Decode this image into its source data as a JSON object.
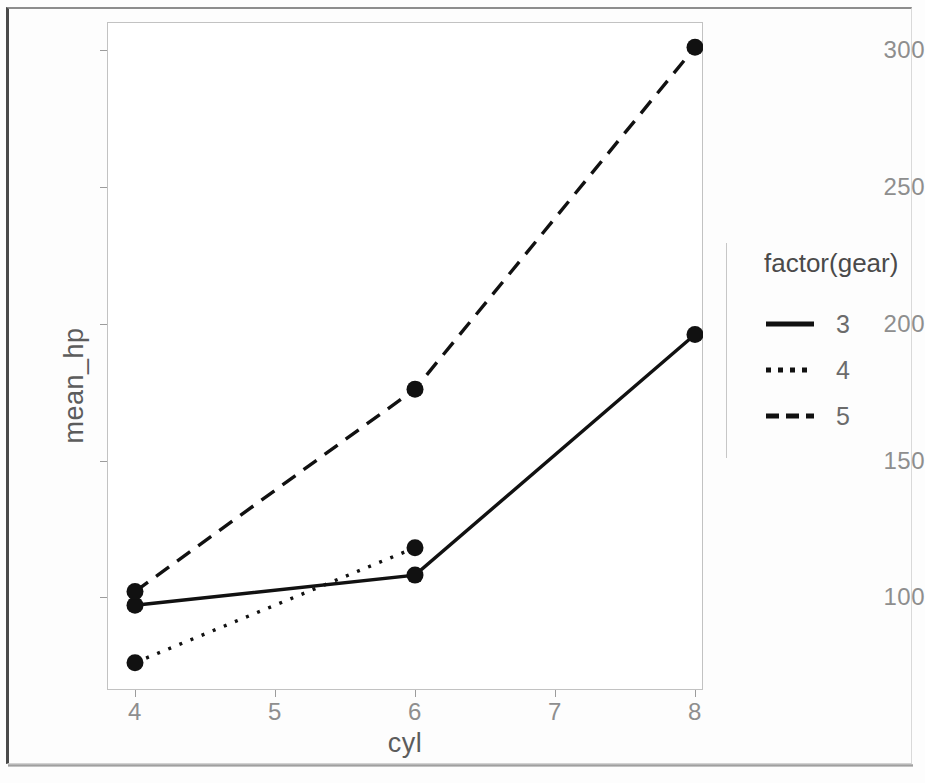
{
  "chart_data": {
    "type": "line",
    "title": "",
    "xlabel": "cyl",
    "ylabel": "mean_hp",
    "x": [
      4,
      6,
      8
    ],
    "xlim": [
      3.8,
      8.2
    ],
    "ylim": [
      68,
      310
    ],
    "x_ticks": [
      "4",
      "5",
      "6",
      "7",
      "8"
    ],
    "x_tick_values": [
      4,
      5,
      6,
      7,
      8
    ],
    "y_ticks": [
      "100",
      "150",
      "200",
      "250",
      "300"
    ],
    "y_tick_values": [
      100,
      150,
      200,
      250,
      300
    ],
    "grid": false,
    "legend_position": "right",
    "legend_title": "factor(gear)",
    "series": [
      {
        "name": "3",
        "linestyle": "solid",
        "color": "#111111",
        "x": [
          4,
          6,
          8
        ],
        "values": [
          97,
          108,
          196
        ]
      },
      {
        "name": "4",
        "linestyle": "dotted",
        "color": "#111111",
        "x": [
          4,
          6
        ],
        "values": [
          76,
          118
        ]
      },
      {
        "name": "5",
        "linestyle": "dashed",
        "color": "#111111",
        "x": [
          4,
          6,
          8
        ],
        "values": [
          102,
          176,
          301
        ]
      }
    ]
  },
  "axes": {
    "y_title": "mean_hp",
    "x_title": "cyl",
    "y_tick_labels": [
      "300",
      "250",
      "200",
      "150",
      "100"
    ],
    "x_tick_labels": [
      "4",
      "5",
      "6",
      "7",
      "8"
    ]
  },
  "legend": {
    "title": "factor(gear)",
    "items": [
      {
        "label": "3",
        "style": "solid"
      },
      {
        "label": "4",
        "style": "dotted"
      },
      {
        "label": "5",
        "style": "dashed"
      }
    ]
  }
}
